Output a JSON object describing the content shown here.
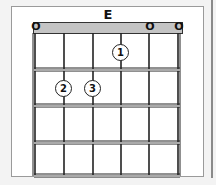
{
  "chord": {
    "name": "E",
    "strings": 6,
    "frets_shown": 4,
    "open_strings": [
      {
        "string": 1,
        "label": "O"
      },
      {
        "string": 5,
        "label": "O"
      },
      {
        "string": 6,
        "label": "O"
      }
    ],
    "fingers": [
      {
        "string": 4,
        "fret": 1,
        "finger": "1"
      },
      {
        "string": 2,
        "fret": 2,
        "finger": "2"
      },
      {
        "string": 3,
        "fret": 2,
        "finger": "3"
      }
    ]
  },
  "colors": {
    "nut": "#c4c4c4",
    "lines": "#222222",
    "background": "#f3f3f3",
    "panel": "#ffffff"
  }
}
